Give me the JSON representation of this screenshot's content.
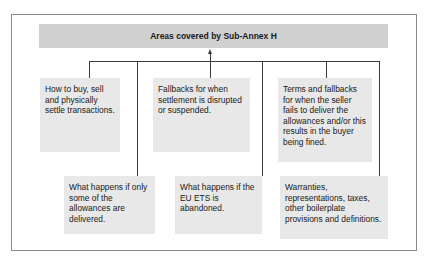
{
  "diagram": {
    "title": "Areas covered by Sub-Annex H",
    "type": "hierarchy",
    "colors": {
      "header_fill": "#d0d0d0",
      "box_fill": "#e8e8e8",
      "connector": "#3a3a3a",
      "frame_border": "#8a8a8a",
      "text": "#1a1a1a"
    },
    "top_row": [
      {
        "id": "buy-sell-settle",
        "text": "How to buy, sell and physically settle transactions."
      },
      {
        "id": "settlement-fallbacks",
        "text": "Fallbacks for when settlement is disrupted or suspended."
      },
      {
        "id": "seller-failure",
        "text": "Terms and fallbacks for when the seller fails to deliver the allowances and/or this results in the buyer being fined."
      }
    ],
    "bottom_row": [
      {
        "id": "partial-delivery",
        "text": "What happens if only some of the allowances are delivered."
      },
      {
        "id": "ets-abandoned",
        "text": "What happens if the EU ETS is abandoned."
      },
      {
        "id": "boilerplate",
        "text": "Warranties, representations, taxes, other boilerplate provisions and definitions."
      }
    ]
  }
}
